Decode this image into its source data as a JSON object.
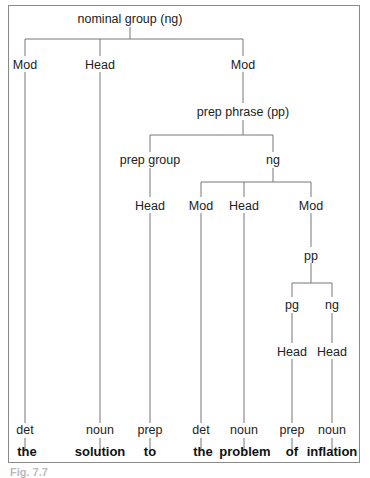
{
  "tree": {
    "root": "nominal group (ng)",
    "level1": {
      "mod1": "Mod",
      "head1": "Head",
      "mod2": "Mod"
    },
    "pp": "prep phrase (pp)",
    "pp_children": {
      "prep_group": "prep group",
      "ng": "ng"
    },
    "level3": {
      "head_pg": "Head",
      "mod": "Mod",
      "head": "Head",
      "mod2": "Mod"
    },
    "sub_pp": "pp",
    "sub_pp_children": {
      "pg": "pg",
      "ng": "ng"
    },
    "sub_heads": {
      "head_pg": "Head",
      "head_ng": "Head"
    },
    "pos": [
      "det",
      "noun",
      "prep",
      "det",
      "noun",
      "prep",
      "noun"
    ],
    "words": [
      "the",
      "solution",
      "to",
      "the",
      "problem",
      "of",
      "inflation"
    ]
  },
  "caption": "Fig. 7.7"
}
